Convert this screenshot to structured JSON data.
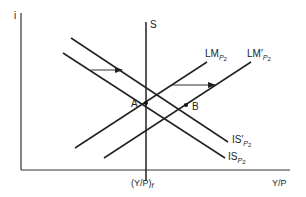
{
  "diagram": {
    "axes": {
      "y_label": "i",
      "x_label": "Y/P",
      "x_marker_label": "(Y/P)",
      "x_marker_subscript": "f"
    },
    "curves": {
      "s_label": "S",
      "lm_label": "LM",
      "lm_sub": "P",
      "lm_sub2": "2",
      "lm_prime_label": "LM′",
      "lm_prime_sub": "P",
      "lm_prime_sub2": "2",
      "is_prime_label": "IS′",
      "is_prime_sub": "P",
      "is_prime_sub2": "2",
      "is_label": "IS",
      "is_sub": "P",
      "is_sub2": "2"
    },
    "points": {
      "a_label": "A",
      "b_label": "B"
    },
    "colors": {
      "line": "#222222",
      "background": "#ffffff"
    }
  }
}
